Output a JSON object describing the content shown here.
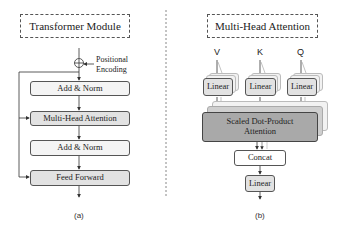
{
  "panel_a": {
    "title": "Transformer Module",
    "positional_encoding": [
      "Positional",
      "Encoding"
    ],
    "blocks": [
      "Add & Norm",
      "Multi-Head Attention",
      "Add & Norm",
      "Feed Forward"
    ],
    "caption": "(a)"
  },
  "panel_b": {
    "title": "Multi-Head Attention",
    "inputs": [
      "V",
      "K",
      "Q"
    ],
    "linear_label": "Linear",
    "attention_label": [
      "Scaled Dot-Product",
      "Attention"
    ],
    "concat_label": "Concat",
    "output_linear_label": "Linear",
    "caption": "(b)"
  },
  "colors": {
    "stroke": "#555555",
    "light_fill": "#f4f4f4",
    "grey_fill": "#e2e2e2",
    "attention_fill": "#a9a9a9"
  }
}
